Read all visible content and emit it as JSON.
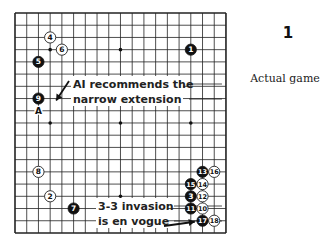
{
  "figure": {
    "number": "1",
    "caption": "Actual game"
  },
  "board": {
    "size": 19,
    "origin": {
      "x": 15,
      "y": 13
    },
    "spacing": {
      "x": 11.72,
      "y": 12.22
    },
    "hoshi": [
      [
        4,
        4
      ],
      [
        10,
        4
      ],
      [
        16,
        4
      ],
      [
        4,
        10
      ],
      [
        10,
        10
      ],
      [
        16,
        10
      ],
      [
        4,
        16
      ],
      [
        10,
        16
      ],
      [
        16,
        16
      ]
    ],
    "stones": [
      {
        "n": "1",
        "color": "black",
        "col": 16,
        "row": 4
      },
      {
        "n": "2",
        "color": "white",
        "col": 4,
        "row": 16
      },
      {
        "n": "3",
        "color": "black",
        "col": 16,
        "row": 16
      },
      {
        "n": "4",
        "color": "white",
        "col": 4,
        "row": 3
      },
      {
        "n": "5",
        "color": "black",
        "col": 3,
        "row": 5
      },
      {
        "n": "6",
        "color": "white",
        "col": 5,
        "row": 4
      },
      {
        "n": "7",
        "color": "black",
        "col": 6,
        "row": 17
      },
      {
        "n": "8",
        "color": "white",
        "col": 3,
        "row": 14
      },
      {
        "n": "9",
        "color": "black",
        "col": 3,
        "row": 8
      },
      {
        "n": "10",
        "color": "white",
        "col": 17,
        "row": 17
      },
      {
        "n": "11",
        "color": "black",
        "col": 16,
        "row": 17
      },
      {
        "n": "12",
        "color": "white",
        "col": 17,
        "row": 16
      },
      {
        "n": "13",
        "color": "black",
        "col": 17,
        "row": 14
      },
      {
        "n": "14",
        "color": "white",
        "col": 17,
        "row": 15
      },
      {
        "n": "15",
        "color": "black",
        "col": 16,
        "row": 15
      },
      {
        "n": "16",
        "color": "white",
        "col": 18,
        "row": 14
      },
      {
        "n": "17",
        "color": "black",
        "col": 17,
        "row": 18
      },
      {
        "n": "18",
        "color": "white",
        "col": 18,
        "row": 18
      }
    ],
    "markers": [
      {
        "label": "A",
        "col": 3,
        "row": 9
      }
    ]
  },
  "annotations": [
    {
      "lines": [
        "AI recommends the",
        "narrow extension"
      ],
      "box": {
        "x": 71,
        "y": 79,
        "w": 120,
        "h": 30
      },
      "arrow_to": {
        "col": 4,
        "row": 8
      }
    },
    {
      "lines": [
        "3-3 invasion",
        "is en vogue"
      ],
      "box": {
        "x": 96,
        "y": 201,
        "w": 80,
        "h": 30
      },
      "arrow_to": {
        "col": 16,
        "row": 18
      }
    }
  ]
}
